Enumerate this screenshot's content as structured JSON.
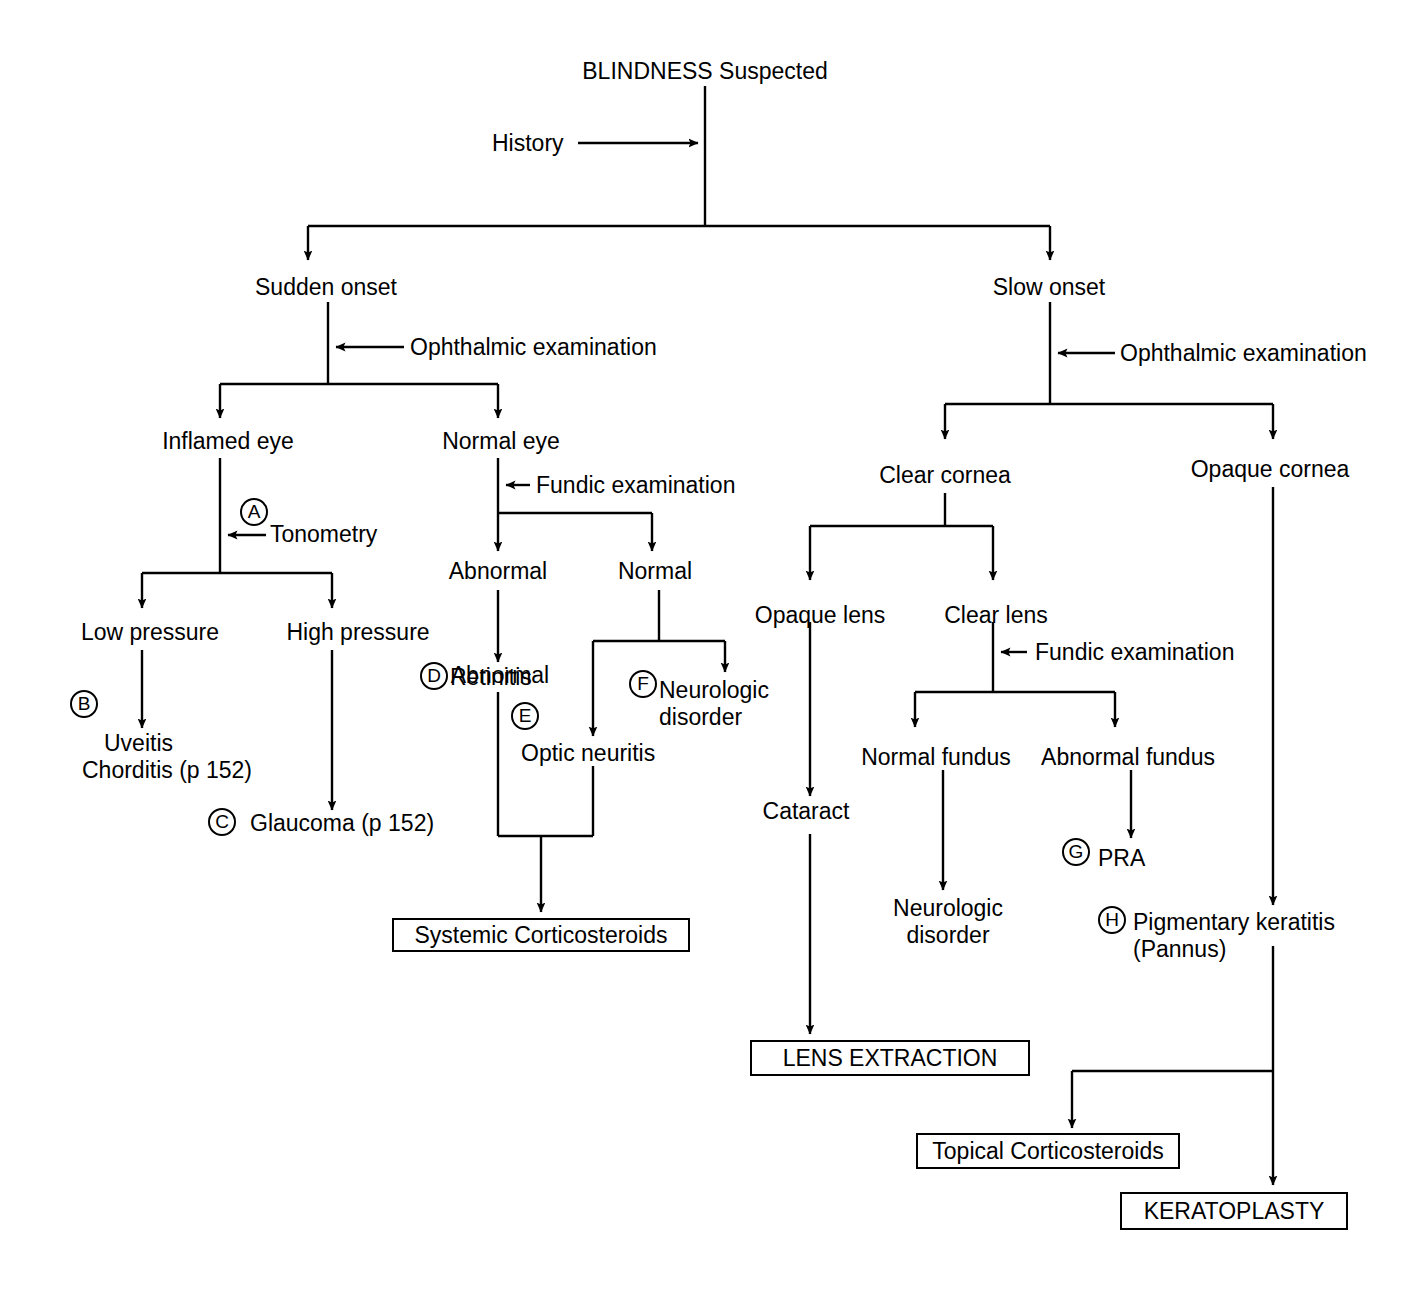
{
  "diagram": {
    "title": "BLINDNESS Suspected",
    "type": "clinical-decision-flowchart",
    "nodes": {
      "root": "BLINDNESS Suspected",
      "history": "History",
      "sudden_onset": "Sudden onset",
      "slow_onset": "Slow onset",
      "ophthalmic_exam_left": "Ophthalmic examination",
      "ophthalmic_exam_right": "Ophthalmic examination",
      "inflamed_eye": "Inflamed eye",
      "normal_eye": "Normal eye",
      "tonometry": "Tonometry",
      "fundic_exam_left": "Fundic examination",
      "low_pressure": "Low pressure",
      "high_pressure": "High pressure",
      "abnormal": "Abnormal",
      "normal": "Normal",
      "uveitis_line1": "Uveitis",
      "uveitis_line2": "Chorditis (p 152)",
      "glaucoma": "Glaucoma (p 152)",
      "retinitis": "Retinitis",
      "optic_neuritis": "Optic neuritis",
      "neurologic_disorder_left_line1": "Neurologic",
      "neurologic_disorder_left_line2": "disorder",
      "systemic_corticosteroids": "Systemic Corticosteroids",
      "clear_cornea": "Clear cornea",
      "opaque_cornea": "Opaque cornea",
      "opaque_lens": "Opaque lens",
      "clear_lens": "Clear lens",
      "fundic_exam_right": "Fundic examination",
      "normal_fundus": "Normal fundus",
      "abnormal_fundus": "Abnormal fundus",
      "cataract": "Cataract",
      "neurologic_disorder_right_line1": "Neurologic",
      "neurologic_disorder_right_line2": "disorder",
      "pra": "PRA",
      "pigmentary_keratitis_line1": "Pigmentary keratitis",
      "pigmentary_keratitis_line2": "(Pannus)",
      "lens_extraction": "LENS EXTRACTION",
      "topical_corticosteroids": "Topical Corticosteroids",
      "keratoplasty": "KERATOPLASTY"
    },
    "reference_markers": {
      "a": "A",
      "b": "B",
      "c": "C",
      "d": "D",
      "e": "E",
      "f": "F",
      "g": "G",
      "h": "H"
    },
    "colors": {
      "line": "#000000",
      "text": "#000000",
      "background": "#ffffff"
    }
  }
}
